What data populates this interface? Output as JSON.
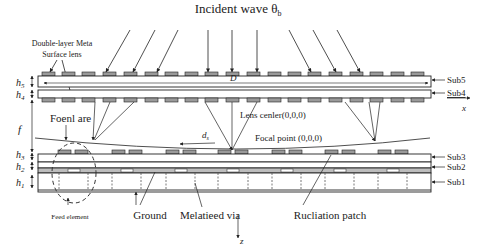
{
  "title": "Incident wave θ",
  "title_sub": "b",
  "labels": {
    "lens": [
      "Double-layer Meta",
      "Surface lens"
    ],
    "D": "D",
    "focal_arc": "Foenl are",
    "lens_center": "Lens cenler(0,0,0)",
    "focal_point": "Focal point (0,0,0)",
    "ds": "d",
    "ds_sub": "s",
    "f": "f",
    "x_axis": "x",
    "z_axis": "z",
    "feed": "Feed element",
    "ground": "Ground",
    "via": "Melatieed via",
    "patch": "Rucliation patch"
  },
  "heights": [
    {
      "name": "h",
      "sub": "5"
    },
    {
      "name": "h",
      "sub": "4"
    },
    {
      "name": "h",
      "sub": "3"
    },
    {
      "name": "h",
      "sub": "2"
    },
    {
      "name": "h",
      "sub": "1"
    }
  ],
  "substrates": [
    "Sub5",
    "Sub4",
    "Sub3",
    "Sub2",
    "Sub1"
  ],
  "colors": {
    "line": "#222222",
    "patch": "#9a9a9a",
    "background": "#ffffff"
  }
}
